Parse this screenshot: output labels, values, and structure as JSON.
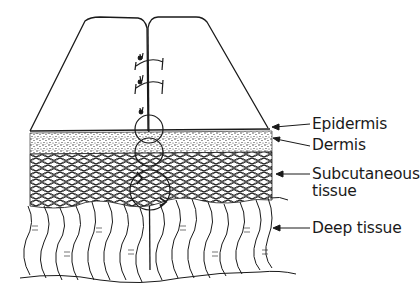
{
  "figure": {
    "type": "anatomical line drawing",
    "labels": [
      {
        "id": "epidermis",
        "text": "Epidermis"
      },
      {
        "id": "dermis",
        "text": "Dermis"
      },
      {
        "id": "subcutaneous",
        "lines": [
          "Subcutaneous",
          "tissue"
        ]
      },
      {
        "id": "deep",
        "text": "Deep tissue"
      }
    ],
    "sutures": {
      "count": 3,
      "style": "interrupted, knots on left of incision"
    },
    "colors": {
      "ink": "#1a1a1a",
      "background": "#ffffff"
    }
  }
}
